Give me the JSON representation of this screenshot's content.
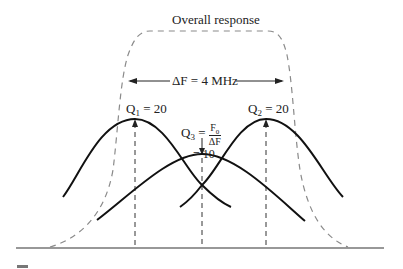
{
  "diagram": {
    "title": "Overall response",
    "bandwidth_label": "ΔF = 4 MHz",
    "q1": {
      "symbol": "Q",
      "sub": "1",
      "value": "= 20"
    },
    "q2": {
      "symbol": "Q",
      "sub": "2",
      "value": "= 20"
    },
    "q3": {
      "symbol": "Q",
      "sub": "3",
      "eq": "=",
      "frac_num": "F",
      "frac_num_sub": "0",
      "frac_den": "ΔF",
      "value": "= 10"
    },
    "colors": {
      "solid_curve": "#111111",
      "dashed_curve": "#8a8a8a",
      "guide_dash": "#333333",
      "baseline": "#333333"
    }
  }
}
